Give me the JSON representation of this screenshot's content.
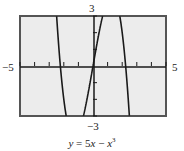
{
  "chart_data": {
    "type": "line",
    "title": "",
    "caption": "y = 5x − x³",
    "function": "5x - x^3",
    "xlim": [
      -5,
      5
    ],
    "ylim": [
      -3,
      3
    ],
    "x_tick_step": 1,
    "y_tick_step": 1,
    "xlabel_left": "−5",
    "xlabel_right": "5",
    "ylabel_top": "3",
    "ylabel_bottom": "−3",
    "grid": false,
    "series": [
      {
        "name": "y = 5x − x³",
        "x": [
          -2.49,
          -2.236,
          -2.0,
          -1.83,
          0.0,
          -0.66,
          0.66,
          2.0,
          2.236,
          2.49,
          1.83
        ],
        "y": [
          3.0,
          0.0,
          -2.0,
          -3.0,
          0.0,
          -3.0,
          3.0,
          2.0,
          0.0,
          -3.0,
          3.0
        ]
      }
    ],
    "colors": {
      "background": "#ececec",
      "frame": "#555555",
      "curve": "#1a1a1a",
      "axis": "#1a1a1a"
    }
  },
  "labels": {
    "y_top": "3",
    "y_bottom": "−3",
    "x_left": "−5",
    "x_right": "5",
    "caption_y": "y",
    "caption_eq": " = 5",
    "caption_x1": "x",
    "caption_minus": " − ",
    "caption_x2": "x",
    "caption_exp": "3"
  }
}
